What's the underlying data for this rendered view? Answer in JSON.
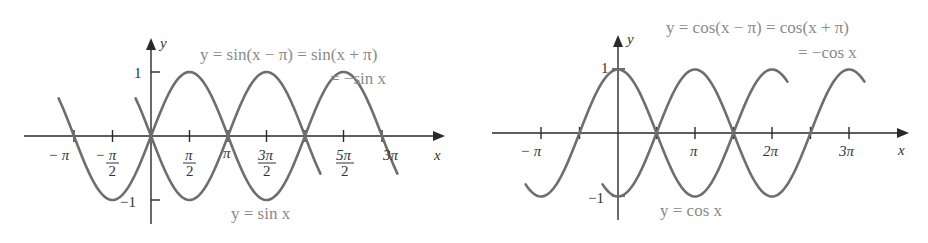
{
  "chart_data": [
    {
      "type": "line",
      "title": "",
      "xlabel": "x",
      "ylabel": "y",
      "ylim": [
        -1,
        1
      ],
      "grid": false,
      "x_ticks": [
        "−π",
        "−π/2",
        "π/2",
        "π",
        "3π/2",
        "5π/2",
        "3π"
      ],
      "y_ticks": [
        "1",
        "−1"
      ],
      "series": [
        {
          "name": "y = sin x",
          "function": "sin(x)",
          "x_range_pi": [
            -1.2,
            3.2
          ]
        },
        {
          "name": "y = sin(x − π) = sin(x + π) = −sin x",
          "function": "-sin(x)",
          "x_range_pi": [
            -0.2,
            2.2
          ]
        }
      ],
      "annotations": [
        "y = sin(x − π) = sin(x + π)",
        "= −sin x",
        "y = sin x"
      ]
    },
    {
      "type": "line",
      "title": "",
      "xlabel": "x",
      "ylabel": "y",
      "ylim": [
        -1,
        1
      ],
      "grid": false,
      "x_ticks": [
        "−π",
        "π",
        "2π",
        "3π"
      ],
      "y_ticks": [
        "1",
        "−1"
      ],
      "series": [
        {
          "name": "y = cos x",
          "function": "cos(x)",
          "x_range_pi": [
            -1.2,
            2.2
          ]
        },
        {
          "name": "y = cos(x − π) = cos(x + π) = −cos x",
          "function": "-cos(x)",
          "x_range_pi": [
            -0.2,
            3.2
          ]
        }
      ],
      "annotations": [
        "y = cos(x − π) = cos(x + π)",
        "= −cos x",
        "y = cos x"
      ]
    }
  ],
  "left": {
    "axis_y": "y",
    "axis_x": "x",
    "ytick_pos": "1",
    "ytick_neg": "−1",
    "label_top_line1": "y = sin(x − π) = sin(x + π)",
    "label_top_line2": "= −sin x",
    "label_bottom": "y = sin x",
    "xt_negpi": "− π",
    "xt_neghalf_num": "− π",
    "xt_den": "2",
    "xt_pi_num": "π",
    "xt_pi": "π",
    "xt_3pi_num": "3π",
    "xt_5pi_num": "5π",
    "xt_3pi": "3π"
  },
  "right": {
    "axis_y": "y",
    "axis_x": "x",
    "ytick_pos": "1",
    "ytick_neg": "−1",
    "label_top_line1": "y = cos(x − π) = cos(x + π)",
    "label_top_line2": "= −cos x",
    "label_bottom": "y = cos x",
    "xt_negpi": "− π",
    "xt_pi": "π",
    "xt_2pi": "2π",
    "xt_3pi": "3π"
  },
  "colors": {
    "curve": "#6e6e6e",
    "axis": "#2a2a2a",
    "label": "#8a8a8a"
  }
}
